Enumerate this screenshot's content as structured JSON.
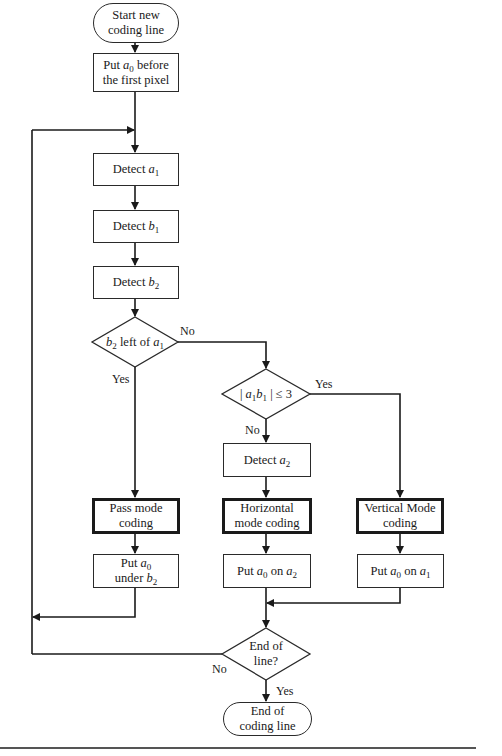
{
  "diagram": {
    "type": "flowchart",
    "nodes": {
      "start": {
        "shape": "terminator",
        "line1": "Start new",
        "line2": "coding line"
      },
      "put_a0_before": {
        "shape": "process",
        "pre": "Put ",
        "var": "a",
        "sub": "0",
        "post": " before",
        "line2": "the first pixel"
      },
      "detect_a1": {
        "shape": "process",
        "pre": "Detect ",
        "var": "a",
        "sub": "1"
      },
      "detect_b1": {
        "shape": "process",
        "pre": "Detect ",
        "var": "b",
        "sub": "1"
      },
      "detect_b2": {
        "shape": "process",
        "pre": "Detect ",
        "var": "b",
        "sub": "2"
      },
      "decision_b2_left_a1": {
        "shape": "decision",
        "var1": "b",
        "sub1": "2",
        "mid": " left of ",
        "var2": "a",
        "sub2": "1"
      },
      "decision_a1b1": {
        "shape": "decision",
        "pre": "| ",
        "var1": "a",
        "sub1": "1",
        "var2": "b",
        "sub2": "1",
        "post": " | ≤ 3"
      },
      "detect_a2": {
        "shape": "process",
        "pre": "Detect ",
        "var": "a",
        "sub": "2"
      },
      "pass_mode": {
        "shape": "process-emphasized",
        "line1": "Pass mode",
        "line2": "coding"
      },
      "horizontal_mode": {
        "shape": "process-emphasized",
        "line1": "Horizontal",
        "line2": "mode coding"
      },
      "vertical_mode": {
        "shape": "process-emphasized",
        "line1": "Vertical Mode",
        "line2": "coding"
      },
      "put_a0_under_b2": {
        "shape": "process",
        "pre": "Put ",
        "var": "a",
        "sub": "0",
        "line2pre": "under ",
        "var2": "b",
        "sub2": "2"
      },
      "put_a0_on_a2": {
        "shape": "process",
        "pre": "Put ",
        "var": "a",
        "sub": "0",
        "mid": " on ",
        "var2": "a",
        "sub2": "2"
      },
      "put_a0_on_a1": {
        "shape": "process",
        "pre": "Put ",
        "var": "a",
        "sub": "0",
        "mid": " on ",
        "var2": "a",
        "sub2": "1"
      },
      "decision_end_of_line": {
        "shape": "decision",
        "line1": "End of",
        "line2": "line?"
      },
      "end": {
        "shape": "terminator",
        "line1": "End of",
        "line2": "coding line"
      }
    },
    "edge_labels": {
      "d1_no": "No",
      "d1_yes": "Yes",
      "d2_yes": "Yes",
      "d2_no": "No",
      "d3_no": "No",
      "d3_yes": "Yes"
    },
    "edges": [
      {
        "from": "start",
        "to": "put_a0_before"
      },
      {
        "from": "put_a0_before",
        "to": "detect_a1"
      },
      {
        "from": "detect_a1",
        "to": "detect_b1"
      },
      {
        "from": "detect_b1",
        "to": "detect_b2"
      },
      {
        "from": "detect_b2",
        "to": "decision_b2_left_a1"
      },
      {
        "from": "decision_b2_left_a1",
        "to": "pass_mode",
        "label": "Yes"
      },
      {
        "from": "decision_b2_left_a1",
        "to": "decision_a1b1",
        "label": "No"
      },
      {
        "from": "decision_a1b1",
        "to": "vertical_mode",
        "label": "Yes"
      },
      {
        "from": "decision_a1b1",
        "to": "detect_a2",
        "label": "No"
      },
      {
        "from": "detect_a2",
        "to": "horizontal_mode"
      },
      {
        "from": "pass_mode",
        "to": "put_a0_under_b2"
      },
      {
        "from": "horizontal_mode",
        "to": "put_a0_on_a2"
      },
      {
        "from": "vertical_mode",
        "to": "put_a0_on_a1"
      },
      {
        "from": "put_a0_under_b2",
        "to": "detect_a1",
        "note": "loop back"
      },
      {
        "from": "put_a0_on_a2",
        "to": "decision_end_of_line"
      },
      {
        "from": "put_a0_on_a1",
        "to": "decision_end_of_line"
      },
      {
        "from": "decision_end_of_line",
        "to": "detect_a1",
        "label": "No"
      },
      {
        "from": "decision_end_of_line",
        "to": "end",
        "label": "Yes"
      }
    ],
    "colors": {
      "stroke": "#1a1a1a",
      "background": "#ffffff"
    }
  }
}
